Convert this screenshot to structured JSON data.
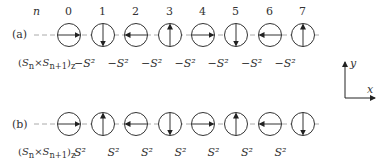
{
  "header": {
    "index_label": "n",
    "indices": [
      "0",
      "1",
      "2",
      "3",
      "4",
      "5",
      "6",
      "7"
    ]
  },
  "rows": [
    {
      "label": "(a)",
      "arrows": [
        "right",
        "down",
        "left",
        "up",
        "right",
        "down",
        "left",
        "up"
      ],
      "product_label": "(S_n × S_n+1)_z",
      "products": [
        "−S²",
        "−S²",
        "−S²",
        "−S²",
        "−S²",
        "−S²",
        "−S²"
      ]
    },
    {
      "label": "(b)",
      "arrows": [
        "right",
        "up",
        "left",
        "down",
        "right",
        "up",
        "left",
        "down"
      ],
      "product_label": "(S_n × S_n+1)_z",
      "products": [
        "S²",
        "S²",
        "S²",
        "S²",
        "S²",
        "S²",
        "S²"
      ]
    }
  ],
  "axes": {
    "x_label": "x",
    "y_label": "y"
  },
  "colors": {
    "line": "#333333",
    "dashed": "#aaaaaa"
  }
}
